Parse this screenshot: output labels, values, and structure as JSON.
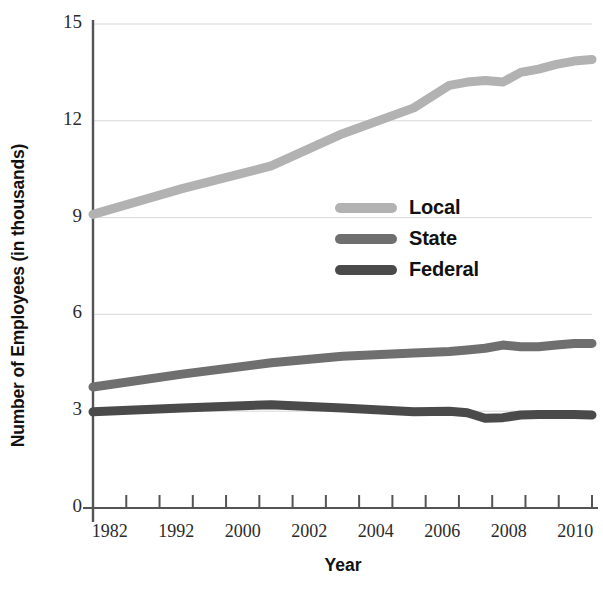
{
  "chart_data": {
    "type": "line",
    "title": "",
    "xlabel": "Year",
    "ylabel": "Number of Employees (in thousands)",
    "x": [
      1982,
      1987,
      1992,
      1996,
      2000,
      2002,
      2003,
      2004,
      2005,
      2006,
      2007,
      2008,
      2009,
      2010
    ],
    "xlim": [
      1982,
      2010
    ],
    "ylim": [
      0,
      15
    ],
    "y_ticks": [
      0,
      3,
      6,
      9,
      12,
      15
    ],
    "y_tick_labels": [
      "0",
      "3",
      "6",
      "9",
      "12",
      "15"
    ],
    "x_tick_labels": [
      "1982",
      "1992",
      "2000",
      "2002",
      "2004",
      "2006",
      "2008",
      "2010"
    ],
    "grid": true,
    "legend_position": "center",
    "series": [
      {
        "name": "Local",
        "color": "#b2b2b2",
        "values": [
          9.1,
          9.9,
          10.6,
          11.6,
          12.4,
          13.1,
          13.2,
          13.25,
          13.2,
          13.5,
          13.6,
          13.75,
          13.85,
          13.9
        ]
      },
      {
        "name": "State",
        "color": "#6f6f6f",
        "values": [
          3.75,
          4.15,
          4.5,
          4.7,
          4.8,
          4.85,
          4.9,
          4.95,
          5.05,
          5.0,
          5.0,
          5.05,
          5.1,
          5.1
        ]
      },
      {
        "name": "Federal",
        "color": "#4a4a4a",
        "values": [
          2.98,
          3.1,
          3.2,
          3.1,
          2.98,
          3.0,
          2.95,
          2.78,
          2.8,
          2.88,
          2.9,
          2.9,
          2.9,
          2.88
        ]
      }
    ]
  },
  "axis": {
    "y_title": "Number of Employees (in thousands)",
    "x_title": "Year"
  },
  "legend": {
    "items": [
      {
        "label": "Local",
        "color": "#b2b2b2"
      },
      {
        "label": "State",
        "color": "#6f6f6f"
      },
      {
        "label": "Federal",
        "color": "#4a4a4a"
      }
    ]
  }
}
